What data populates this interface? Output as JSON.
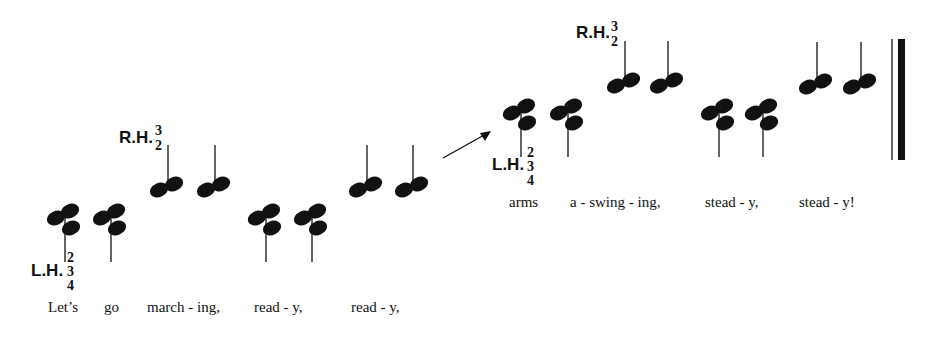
{
  "colors": {
    "ink": "#111111",
    "background": "#ffffff"
  },
  "line1": {
    "lh_label": "L.H.",
    "lh_fingers": [
      "2",
      "3",
      "4"
    ],
    "rh_label": "R.H.",
    "rh_fingers": [
      "3",
      "2"
    ],
    "lyrics": [
      "Let’s",
      "go",
      "march - ing,",
      "read - y,",
      "read - y,"
    ]
  },
  "line2": {
    "lh_label": "L.H.",
    "lh_fingers": [
      "2",
      "3",
      "4"
    ],
    "rh_label": "R.H.",
    "rh_fingers": [
      "3",
      "2"
    ],
    "lyrics": [
      "arms",
      "a - swing - ing,",
      "stead - y,",
      "stead - y!"
    ]
  },
  "symbols": {
    "continuation": "arrow-icon",
    "ending": "final-barline"
  }
}
